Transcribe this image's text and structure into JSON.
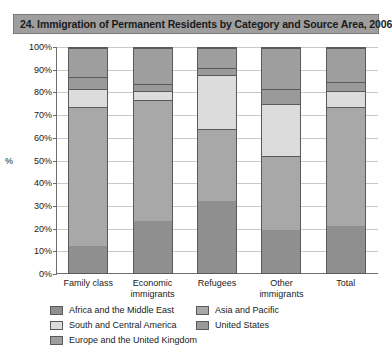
{
  "figure": {
    "number_and_title": "24. Immigration of Permanent Residents by Category and Source Area, 2006"
  },
  "axes": {
    "y_axis_title": "%",
    "y_tick_labels": [
      "100%",
      "90%",
      "80%",
      "70%",
      "60%",
      "50%",
      "40%",
      "30%",
      "20%",
      "10%",
      "0%"
    ]
  },
  "legend": {
    "entries": [
      {
        "label": "Africa and the Middle East",
        "color": "#8f8f8f"
      },
      {
        "label": "Asia and Pacific",
        "color": "#a8a8a8"
      },
      {
        "label": "South and Central America",
        "color": "#dcdcdc"
      },
      {
        "label": "United States",
        "color": "#9a9a9a"
      },
      {
        "label": "Europe and the United Kingdom",
        "color": "#9e9e9e"
      }
    ]
  },
  "chart_data": {
    "type": "bar",
    "subtype": "stacked-100-percent",
    "title": "24. Immigration of Permanent Residents by Category and Source Area, 2006",
    "xlabel": "",
    "ylabel": "%",
    "ylim": [
      0,
      100
    ],
    "ytick_step": 10,
    "grid": true,
    "legend_position": "bottom",
    "categories": [
      "Family class",
      "Economic immigrants",
      "Refugees",
      "Other immigrants",
      "Total"
    ],
    "series": [
      {
        "name": "Africa and the Middle East",
        "color": "#8f8f8f",
        "values": [
          12,
          23,
          32,
          19,
          21
        ]
      },
      {
        "name": "Asia and Pacific",
        "color": "#a8a8a8",
        "values": [
          62,
          54,
          32,
          33,
          53
        ]
      },
      {
        "name": "South and Central America",
        "color": "#dcdcdc",
        "values": [
          8,
          4,
          24,
          23,
          7
        ]
      },
      {
        "name": "United States",
        "color": "#9a9a9a",
        "values": [
          5,
          3,
          3,
          7,
          4
        ]
      },
      {
        "name": "Europe and the United Kingdom",
        "color": "#9e9e9e",
        "values": [
          13,
          16,
          9,
          18,
          15
        ]
      }
    ]
  }
}
